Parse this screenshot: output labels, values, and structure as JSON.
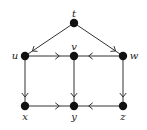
{
  "diagram": {
    "type": "directed-graph",
    "nodes": [
      {
        "id": "t",
        "label": "t",
        "x": 74,
        "y": 23,
        "label_dx": 0,
        "label_dy": -6
      },
      {
        "id": "u",
        "label": "u",
        "x": 25,
        "y": 56,
        "label_dx": -10,
        "label_dy": 3
      },
      {
        "id": "v",
        "label": "v",
        "x": 74,
        "y": 56,
        "label_dx": 0,
        "label_dy": -6
      },
      {
        "id": "w",
        "label": "w",
        "x": 123,
        "y": 56,
        "label_dx": 11,
        "label_dy": 3
      },
      {
        "id": "x",
        "label": "x",
        "x": 25,
        "y": 106,
        "label_dx": 0,
        "label_dy": 14
      },
      {
        "id": "y",
        "label": "y",
        "x": 74,
        "y": 106,
        "label_dx": 0,
        "label_dy": 14
      },
      {
        "id": "z",
        "label": "z",
        "x": 123,
        "y": 106,
        "label_dx": 0,
        "label_dy": 14
      }
    ],
    "edges": [
      {
        "from": "t",
        "to": "u"
      },
      {
        "from": "t",
        "to": "w"
      },
      {
        "from": "u",
        "to": "v"
      },
      {
        "from": "w",
        "to": "v"
      },
      {
        "from": "u",
        "to": "x"
      },
      {
        "from": "v",
        "to": "y"
      },
      {
        "from": "w",
        "to": "z"
      },
      {
        "from": "x",
        "to": "y"
      },
      {
        "from": "z",
        "to": "y"
      }
    ],
    "colors": {
      "node": "#111111",
      "edge": "#333333",
      "background": "#ffffff"
    }
  }
}
